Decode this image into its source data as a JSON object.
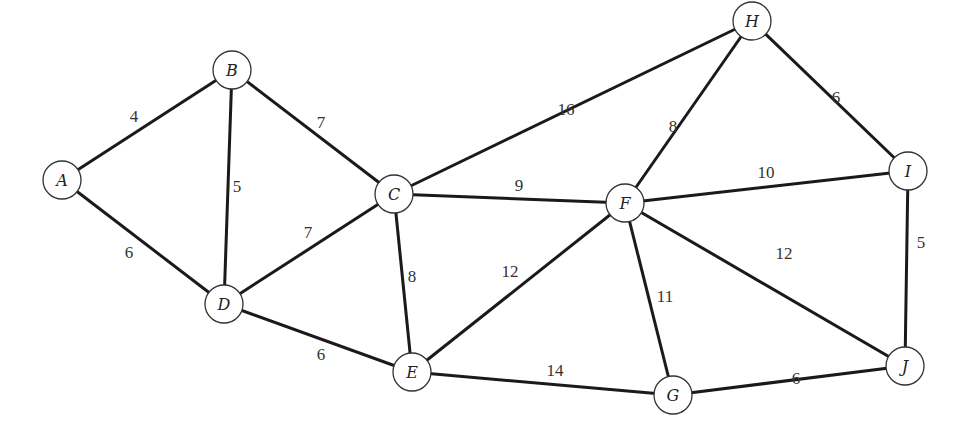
{
  "diagram": {
    "type": "weighted-undirected-graph",
    "node_radius": 19,
    "nodes": [
      {
        "id": "A",
        "label": "A",
        "x": 62,
        "y": 180
      },
      {
        "id": "B",
        "label": "B",
        "x": 232,
        "y": 70
      },
      {
        "id": "C",
        "label": "C",
        "x": 394,
        "y": 194
      },
      {
        "id": "D",
        "label": "D",
        "x": 224,
        "y": 304
      },
      {
        "id": "E",
        "label": "E",
        "x": 412,
        "y": 372
      },
      {
        "id": "F",
        "label": "F",
        "x": 625,
        "y": 203
      },
      {
        "id": "G",
        "label": "G",
        "x": 673,
        "y": 395
      },
      {
        "id": "H",
        "label": "H",
        "x": 752,
        "y": 21
      },
      {
        "id": "I",
        "label": "I",
        "x": 908,
        "y": 171
      },
      {
        "id": "J",
        "label": "J",
        "x": 905,
        "y": 366
      }
    ],
    "edges": [
      {
        "from": "A",
        "to": "B",
        "weight": "4",
        "lx": 134,
        "ly": 116
      },
      {
        "from": "A",
        "to": "D",
        "weight": "6",
        "lx": 129,
        "ly": 252
      },
      {
        "from": "B",
        "to": "D",
        "weight": "5",
        "lx": 237,
        "ly": 186
      },
      {
        "from": "B",
        "to": "C",
        "weight": "7",
        "lx": 321,
        "ly": 122
      },
      {
        "from": "D",
        "to": "C",
        "weight": "7",
        "lx": 308,
        "ly": 232
      },
      {
        "from": "D",
        "to": "E",
        "weight": "6",
        "lx": 321,
        "ly": 354
      },
      {
        "from": "C",
        "to": "E",
        "weight": "8",
        "lx": 412,
        "ly": 276
      },
      {
        "from": "C",
        "to": "F",
        "weight": "9",
        "lx": 519,
        "ly": 185
      },
      {
        "from": "C",
        "to": "H",
        "weight": "16",
        "lx": 566,
        "ly": 109
      },
      {
        "from": "E",
        "to": "F",
        "weight": "12",
        "lx": 510,
        "ly": 271
      },
      {
        "from": "E",
        "to": "G",
        "weight": "14",
        "lx": 555,
        "ly": 370
      },
      {
        "from": "F",
        "to": "H",
        "weight": "8",
        "lx": 673,
        "ly": 126
      },
      {
        "from": "F",
        "to": "I",
        "weight": "10",
        "lx": 766,
        "ly": 172
      },
      {
        "from": "F",
        "to": "G",
        "weight": "11",
        "lx": 665,
        "ly": 296
      },
      {
        "from": "F",
        "to": "J",
        "weight": "12",
        "lx": 784,
        "ly": 253
      },
      {
        "from": "H",
        "to": "I",
        "weight": "6",
        "lx": 836,
        "ly": 97
      },
      {
        "from": "I",
        "to": "J",
        "weight": "5",
        "lx": 921,
        "ly": 242
      },
      {
        "from": "G",
        "to": "J",
        "weight": "6",
        "lx": 796,
        "ly": 378
      }
    ]
  }
}
